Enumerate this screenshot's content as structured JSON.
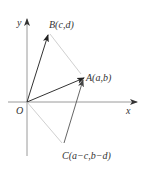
{
  "diagram": {
    "axes": {
      "x_label": "x",
      "y_label": "y",
      "origin_label": "O"
    },
    "points": {
      "A": {
        "label": "A(a,b)"
      },
      "B": {
        "label": "B(c,d)"
      },
      "C": {
        "label": "C(a−c,b−d)"
      }
    },
    "vectors": [
      {
        "from": "O",
        "to": "B",
        "style": "dark-arrow"
      },
      {
        "from": "O",
        "to": "A",
        "style": "dark-arrow"
      },
      {
        "from": "B",
        "to": "A",
        "style": "light-line"
      },
      {
        "from": "O",
        "to": "C",
        "style": "light-line"
      },
      {
        "from": "C",
        "to": "A",
        "style": "medium-arrow"
      }
    ],
    "colors": {
      "axis": "#9a9a9a",
      "dark_vector": "#333333",
      "light_vector": "#d0d0d0",
      "medium_vector": "#666666",
      "label": "#333333"
    }
  }
}
